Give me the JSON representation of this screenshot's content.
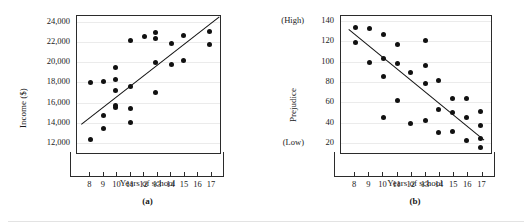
{
  "figure": {
    "bottom_rule": "divider",
    "panels": [
      {
        "caption": "(a)",
        "xlabel": "Years of school",
        "ylabel": "Income ($)",
        "y_side_top": "",
        "y_side_bottom": ""
      },
      {
        "caption": "(b)",
        "xlabel": "Years of school",
        "ylabel": "Prejudice",
        "y_side_top": "(High)",
        "y_side_bottom": "(Low)"
      }
    ]
  },
  "chart_data": [
    {
      "type": "scatter",
      "title": "",
      "panel": "(a)",
      "xlabel": "Years of school",
      "ylabel": "Income ($)",
      "xlim": [
        7.0,
        17.6
      ],
      "ylim": [
        11000,
        24600
      ],
      "xticks": [
        8,
        9,
        10,
        11,
        12,
        13,
        14,
        15,
        16,
        17
      ],
      "xticklabels": [
        "8",
        "9",
        "10",
        "11",
        "12",
        "13",
        "14",
        "15",
        "16",
        "17"
      ],
      "yticks": [
        12000,
        14000,
        16000,
        18000,
        20000,
        22000,
        24000
      ],
      "yticklabels": [
        "12,000",
        "14,000",
        "16,000",
        "18,000",
        "20,000",
        "22,000",
        "24,000"
      ],
      "grid": true,
      "legend": "none",
      "points": [
        [
          8.0,
          18000
        ],
        [
          8.0,
          12300
        ],
        [
          9.0,
          18100
        ],
        [
          9.0,
          14700
        ],
        [
          9.0,
          13400
        ],
        [
          9.85,
          19450
        ],
        [
          9.85,
          18300
        ],
        [
          9.85,
          17200
        ],
        [
          9.85,
          15500
        ],
        [
          9.85,
          15700
        ],
        [
          11.0,
          22200
        ],
        [
          11.0,
          17600
        ],
        [
          11.0,
          15400
        ],
        [
          11.0,
          14050
        ],
        [
          12.0,
          22550
        ],
        [
          12.85,
          23000
        ],
        [
          12.85,
          22400
        ],
        [
          12.85,
          20000
        ],
        [
          12.85,
          17000
        ],
        [
          14.0,
          21900
        ],
        [
          14.0,
          19750
        ],
        [
          14.9,
          22700
        ],
        [
          14.9,
          20150
        ],
        [
          16.8,
          23100
        ],
        [
          16.8,
          21800
        ]
      ],
      "fit_line": {
        "x0": 7.3,
        "y0": 13900,
        "x1": 17.55,
        "y1": 24600
      }
    },
    {
      "type": "scatter",
      "title": "",
      "panel": "(b)",
      "xlabel": "Years of school",
      "ylabel": "Prejudice",
      "y_axis_high_label": "(High)",
      "y_axis_low_label": "(Low)",
      "xlim": [
        7.0,
        17.6
      ],
      "ylim": [
        10,
        145
      ],
      "xticks": [
        8,
        9,
        10,
        11,
        12,
        13,
        14,
        15,
        16,
        17
      ],
      "xticklabels": [
        "8",
        "9",
        "10",
        "11",
        "12",
        "13",
        "14",
        "15",
        "16",
        "17"
      ],
      "yticks": [
        20,
        40,
        60,
        80,
        100,
        120,
        140
      ],
      "yticklabels": [
        "20",
        "40",
        "60",
        "80",
        "100",
        "120",
        "140"
      ],
      "grid": true,
      "legend": "none",
      "points": [
        [
          8.0,
          134
        ],
        [
          8.0,
          119
        ],
        [
          9.0,
          133
        ],
        [
          9.0,
          99
        ],
        [
          10.0,
          127
        ],
        [
          10.0,
          103
        ],
        [
          10.0,
          85
        ],
        [
          10.0,
          45
        ],
        [
          11.0,
          117
        ],
        [
          11.0,
          98
        ],
        [
          11.0,
          62
        ],
        [
          11.9,
          89
        ],
        [
          11.9,
          39
        ],
        [
          12.95,
          121
        ],
        [
          12.95,
          96
        ],
        [
          12.95,
          78
        ],
        [
          12.95,
          42
        ],
        [
          13.9,
          81
        ],
        [
          13.9,
          53
        ],
        [
          13.9,
          30
        ],
        [
          14.9,
          64
        ],
        [
          14.9,
          50
        ],
        [
          14.9,
          31
        ],
        [
          15.85,
          64
        ],
        [
          15.85,
          45
        ],
        [
          15.85,
          22
        ],
        [
          16.85,
          51
        ],
        [
          16.85,
          37
        ],
        [
          16.85,
          24
        ],
        [
          16.85,
          15
        ]
      ],
      "fit_line": {
        "x0": 7.55,
        "y0": 132,
        "x1": 17.1,
        "y1": 23
      }
    }
  ]
}
